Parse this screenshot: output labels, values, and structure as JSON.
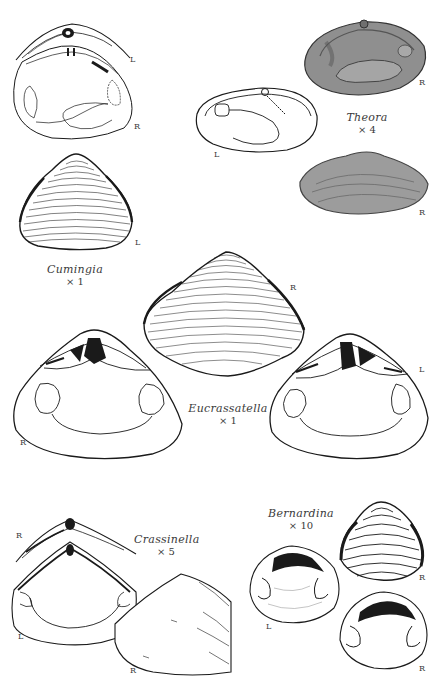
{
  "page": {
    "running_head_left": "",
    "running_head_right": "",
    "background": "#ffffff",
    "ink_color": "#1a1a1a",
    "caption_color": "#3a3a3a",
    "shaded_fill": "#9a9a9a"
  },
  "figures": [
    {
      "genus": "Cumingia",
      "magnification": "× 1",
      "views": [
        {
          "id": "hinge-detail",
          "label": "L"
        },
        {
          "id": "interior",
          "label": "R"
        },
        {
          "id": "exterior",
          "label": "L"
        }
      ]
    },
    {
      "genus": "Theora",
      "magnification": "× 4",
      "views": [
        {
          "id": "interior-shaded",
          "label": "R"
        },
        {
          "id": "interior-outline",
          "label": "L"
        },
        {
          "id": "exterior-shaded",
          "label": "R"
        }
      ]
    },
    {
      "genus": "Eucrassatella",
      "magnification": "× 1",
      "views": [
        {
          "id": "exterior",
          "label": "R"
        },
        {
          "id": "interior-right",
          "label": "R"
        },
        {
          "id": "interior-left",
          "label": "L"
        }
      ]
    },
    {
      "genus": "Crassinella",
      "magnification": "× 5",
      "views": [
        {
          "id": "hinge-detail",
          "label": "R"
        },
        {
          "id": "interior",
          "label": "L"
        },
        {
          "id": "exterior",
          "label": "R"
        }
      ]
    },
    {
      "genus": "Bernardina",
      "magnification": "× 10",
      "views": [
        {
          "id": "interior-left",
          "label": "L"
        },
        {
          "id": "exterior",
          "label": "R"
        },
        {
          "id": "interior-right",
          "label": "R"
        }
      ]
    }
  ]
}
